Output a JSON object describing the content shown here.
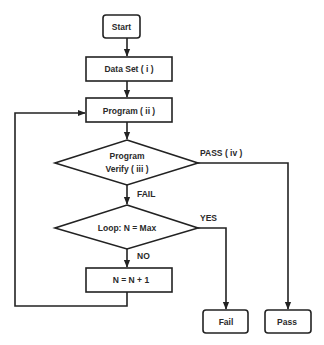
{
  "nodes": {
    "start": "Start",
    "data_set": "Data Set ( i )",
    "program": "Program ( ii )",
    "verify_line1": "Program",
    "verify_line2": "Verify ( iii )",
    "loop_check": "Loop: N = Max",
    "increment": "N = N + 1",
    "fail": "Fail",
    "pass": "Pass"
  },
  "edges": {
    "pass_label": "PASS ( iv )",
    "fail_label": "FAIL",
    "yes_label": "YES",
    "no_label": "NO"
  },
  "colors": {
    "stroke": "#222222",
    "text": "#2a2a2a",
    "background": "#ffffff"
  }
}
